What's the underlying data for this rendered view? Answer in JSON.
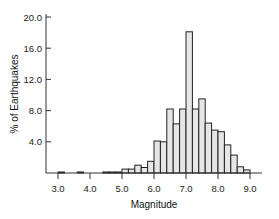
{
  "chart_data": {
    "type": "bar",
    "subtype": "histogram",
    "title": "",
    "xlabel": "Magnitude",
    "ylabel": "% of Earthquakes",
    "xlim": [
      2.6,
      9.6
    ],
    "ylim": [
      0,
      20
    ],
    "x_ticks": [
      "3.0",
      "4.0",
      "5.0",
      "6.0",
      "7.0",
      "8.0",
      "9.0"
    ],
    "x_tick_values": [
      3.0,
      4.0,
      5.0,
      6.0,
      7.0,
      8.0,
      9.0
    ],
    "y_ticks": [
      "4.0",
      "8.0",
      "12.0",
      "16.0",
      "20.0"
    ],
    "y_tick_values": [
      4,
      8,
      12,
      16,
      20
    ],
    "grid": false,
    "legend": null,
    "bin_width": 0.2,
    "bins": [
      {
        "start": 3.0,
        "value": 0.1
      },
      {
        "start": 3.6,
        "value": 0.1
      },
      {
        "start": 4.4,
        "value": 0.05
      },
      {
        "start": 4.6,
        "value": 0.05
      },
      {
        "start": 4.8,
        "value": 0.05
      },
      {
        "start": 5.0,
        "value": 0.5
      },
      {
        "start": 5.2,
        "value": 0.5
      },
      {
        "start": 5.4,
        "value": 1.0
      },
      {
        "start": 5.6,
        "value": 0.7
      },
      {
        "start": 5.8,
        "value": 1.5
      },
      {
        "start": 6.0,
        "value": 4.1
      },
      {
        "start": 6.2,
        "value": 4.0
      },
      {
        "start": 6.4,
        "value": 8.2
      },
      {
        "start": 6.6,
        "value": 6.3
      },
      {
        "start": 6.8,
        "value": 8.2
      },
      {
        "start": 7.0,
        "value": 18.1
      },
      {
        "start": 7.2,
        "value": 8.2
      },
      {
        "start": 7.4,
        "value": 9.5
      },
      {
        "start": 7.6,
        "value": 6.4
      },
      {
        "start": 7.8,
        "value": 5.5
      },
      {
        "start": 8.0,
        "value": 5.3
      },
      {
        "start": 8.2,
        "value": 3.6
      },
      {
        "start": 8.4,
        "value": 2.3
      },
      {
        "start": 8.6,
        "value": 0.8
      },
      {
        "start": 8.8,
        "value": 0.4
      }
    ],
    "colors": {
      "bar_fill": "#e6e6e6",
      "bar_stroke": "#222222",
      "axis": "#333333"
    }
  }
}
